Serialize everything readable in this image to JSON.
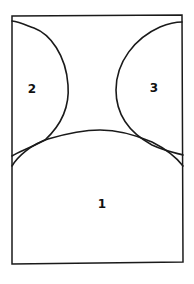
{
  "diagram": {
    "type": "region-partition",
    "regions": [
      {
        "id": "region-1",
        "label": "1",
        "position": "bottom"
      },
      {
        "id": "region-2",
        "label": "2",
        "position": "top-left"
      },
      {
        "id": "region-3",
        "label": "3",
        "position": "top-right"
      }
    ],
    "colors": {
      "stroke": "#1a1a1a",
      "background": "#ffffff"
    }
  }
}
